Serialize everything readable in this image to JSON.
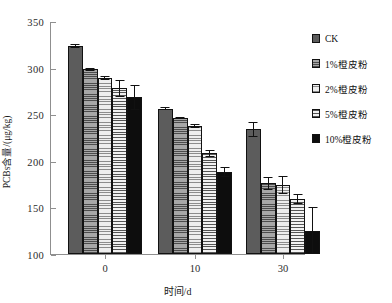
{
  "chart_data": {
    "type": "bar",
    "title": "",
    "xlabel": "时间/d",
    "ylabel": "PCBs含量/(μg/kg)",
    "categories": [
      "0",
      "10",
      "30"
    ],
    "ylim": [
      100,
      350
    ],
    "yticks": [
      100,
      150,
      200,
      250,
      300,
      350
    ],
    "grid": false,
    "legend_position": "right",
    "series": [
      {
        "name": "CK",
        "pattern": "dotted-dark-gray",
        "color": "#5c5c5c",
        "values": [
          323,
          256,
          234
        ],
        "errors": [
          2,
          2,
          8
        ]
      },
      {
        "name": "1%橙皮粉",
        "pattern": "fine-horizontal-medium-gray",
        "color": "#8a8a8a",
        "values": [
          298,
          246,
          176
        ],
        "errors": [
          2,
          1,
          7
        ]
      },
      {
        "name": "2%橙皮粉",
        "pattern": "light-horizontal-light-gray",
        "color": "#cfcfcf",
        "values": [
          289,
          237,
          174
        ],
        "errors": [
          2,
          2,
          10
        ]
      },
      {
        "name": "5%橙皮粉",
        "pattern": "horizontal-lines",
        "color": "#bdbdbd",
        "values": [
          278,
          208,
          159
        ],
        "errors": [
          9,
          4,
          5
        ]
      },
      {
        "name": "10%橙皮粉",
        "pattern": "solid-black",
        "color": "#0d0d0d",
        "values": [
          268,
          188,
          125
        ],
        "errors": [
          13,
          5,
          25
        ]
      }
    ]
  },
  "axis": {
    "y_tick_labels": [
      "350",
      "300",
      "250",
      "200",
      "150",
      "100"
    ],
    "x_tick_labels": [
      "0",
      "10",
      "30"
    ],
    "y_title": "PCBs含量/(μg/kg)",
    "x_title": "时间/d"
  },
  "legend": {
    "items": [
      {
        "label": "CK"
      },
      {
        "label": "1%橙皮粉"
      },
      {
        "label": "2%橙皮粉"
      },
      {
        "label": "5%橙皮粉"
      },
      {
        "label": "10%橙皮粉"
      }
    ]
  }
}
